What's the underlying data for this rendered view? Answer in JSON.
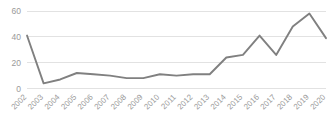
{
  "chart_data": {
    "type": "line",
    "title": "",
    "subtitle": "",
    "xlabel": "",
    "ylabel": "",
    "categories": [
      "2002",
      "2003",
      "2004",
      "2005",
      "2006",
      "2007",
      "2008",
      "2009",
      "2010",
      "2011",
      "2012",
      "2013",
      "2014",
      "2015",
      "2016",
      "2017",
      "2018",
      "2019",
      "2020"
    ],
    "values": [
      41,
      4,
      7,
      12,
      11,
      10,
      8,
      8,
      11,
      10,
      11,
      11,
      24,
      26,
      41,
      26,
      48,
      58,
      39
    ],
    "series": [
      {
        "name": "",
        "values": [
          41,
          4,
          7,
          12,
          11,
          10,
          8,
          8,
          11,
          10,
          11,
          11,
          24,
          26,
          41,
          26,
          48,
          58,
          39
        ]
      }
    ],
    "ylim": [
      0,
      60
    ],
    "yticks": [
      0,
      20,
      40,
      60
    ],
    "ytick_labels": [
      "0",
      "20",
      "40",
      "60"
    ],
    "xtick_labels": [
      "2002",
      "2003",
      "2004",
      "2005",
      "2006",
      "2007",
      "2008",
      "2009",
      "2010",
      "2011",
      "2012",
      "2013",
      "2014",
      "2015",
      "2016",
      "2017",
      "2018",
      "2019",
      "2020"
    ],
    "xtick_rotation_deg": -45,
    "grid": {
      "horizontal": true,
      "vertical": false,
      "color": "#e2e2e2"
    },
    "legend": {
      "visible": false,
      "position": "none",
      "entries": []
    },
    "markers": false,
    "line_color": "#808080",
    "line_width": 1.9,
    "axis_label_color": "#9a9a9a",
    "background_color": "#ffffff",
    "annotations": []
  },
  "axes": {
    "y_tick_0": "0",
    "y_tick_1": "20",
    "y_tick_2": "40",
    "y_tick_3": "60"
  }
}
